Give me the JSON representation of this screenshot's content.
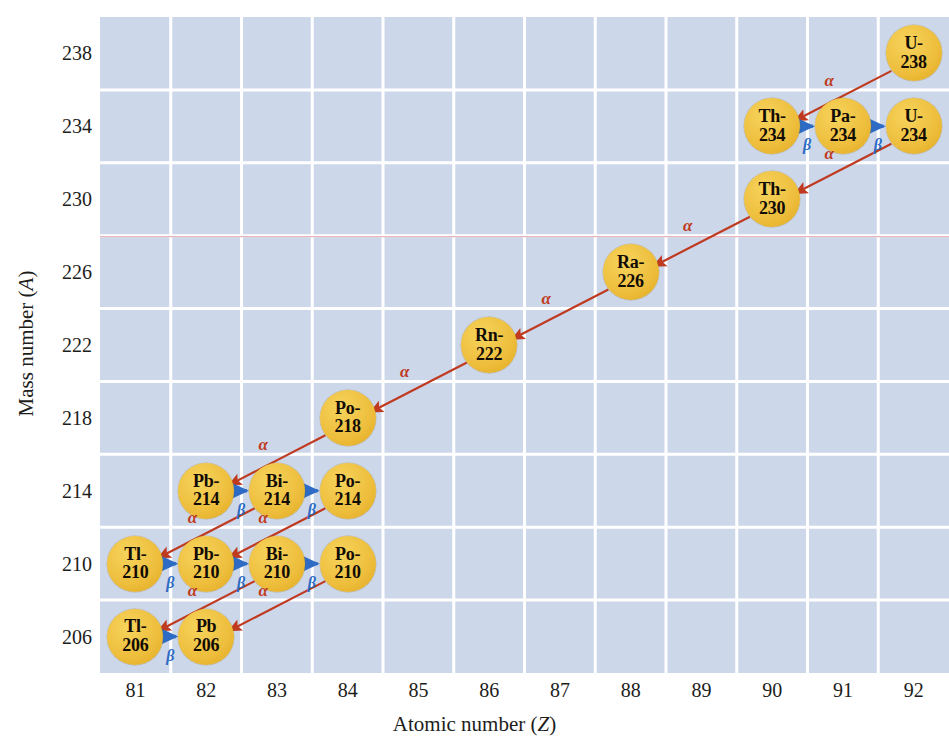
{
  "figure": {
    "kind": "uranium-238-decay-series-chart",
    "background": "#ffffff",
    "panel_color": "#ccd7ea",
    "grid_color": "#ffffff",
    "highlight_line_color": "#e8b7bd",
    "bubble_color": "#eebe3d",
    "alpha_color": "#c03a20",
    "beta_color": "#2e6bc4"
  },
  "axes": {
    "x": {
      "title_text": "Atomic number (",
      "title_italic": "Z",
      "title_tail": ")",
      "ticks": [
        "81",
        "82",
        "83",
        "84",
        "85",
        "86",
        "87",
        "88",
        "89",
        "90",
        "91",
        "92"
      ],
      "min": 80.5,
      "max": 92.5
    },
    "y": {
      "title_text": "Mass number (",
      "title_italic": "A",
      "title_tail": ")",
      "ticks": [
        "238",
        "234",
        "230",
        "226",
        "222",
        "218",
        "214",
        "210",
        "206"
      ],
      "min": 204,
      "max": 240
    }
  },
  "chart_data": {
    "type": "scatter",
    "title": "",
    "xlabel": "Atomic number (Z)",
    "ylabel": "Mass number (A)",
    "xlim": [
      80.5,
      92.5
    ],
    "ylim": [
      204,
      240
    ],
    "grid": true,
    "legend": "none",
    "nuclides": [
      {
        "id": "U-238",
        "symbol": "U-",
        "mass": "238",
        "z": 92,
        "a": 238
      },
      {
        "id": "Th-234",
        "symbol": "Th-",
        "mass": "234",
        "z": 90,
        "a": 234
      },
      {
        "id": "Pa-234",
        "symbol": "Pa-",
        "mass": "234",
        "z": 91,
        "a": 234
      },
      {
        "id": "U-234",
        "symbol": "U-",
        "mass": "234",
        "z": 92,
        "a": 234
      },
      {
        "id": "Th-230",
        "symbol": "Th-",
        "mass": "230",
        "z": 90,
        "a": 230
      },
      {
        "id": "Ra-226",
        "symbol": "Ra-",
        "mass": "226",
        "z": 88,
        "a": 226
      },
      {
        "id": "Rn-222",
        "symbol": "Rn-",
        "mass": "222",
        "z": 86,
        "a": 222
      },
      {
        "id": "Po-218",
        "symbol": "Po-",
        "mass": "218",
        "z": 84,
        "a": 218
      },
      {
        "id": "Pb-214",
        "symbol": "Pb-",
        "mass": "214",
        "z": 82,
        "a": 214
      },
      {
        "id": "Bi-214",
        "symbol": "Bi-",
        "mass": "214",
        "z": 83,
        "a": 214
      },
      {
        "id": "Po-214",
        "symbol": "Po-",
        "mass": "214",
        "z": 84,
        "a": 214
      },
      {
        "id": "Tl-210",
        "symbol": "Tl-",
        "mass": "210",
        "z": 81,
        "a": 210
      },
      {
        "id": "Pb-210",
        "symbol": "Pb-",
        "mass": "210",
        "z": 82,
        "a": 210
      },
      {
        "id": "Bi-210",
        "symbol": "Bi-",
        "mass": "210",
        "z": 83,
        "a": 210
      },
      {
        "id": "Po-210",
        "symbol": "Po-",
        "mass": "210",
        "z": 84,
        "a": 210
      },
      {
        "id": "Tl-206",
        "symbol": "Tl-",
        "mass": "206",
        "z": 81,
        "a": 206
      },
      {
        "id": "Pb-206",
        "symbol": "Pb",
        "mass": "206",
        "z": 82,
        "a": 206
      }
    ],
    "decays": [
      {
        "from": "U-238",
        "to": "Th-234",
        "mode": "alpha",
        "label": "α"
      },
      {
        "from": "Th-234",
        "to": "Pa-234",
        "mode": "beta",
        "label": "β"
      },
      {
        "from": "Pa-234",
        "to": "U-234",
        "mode": "beta",
        "label": "β"
      },
      {
        "from": "U-234",
        "to": "Th-230",
        "mode": "alpha",
        "label": "α"
      },
      {
        "from": "Th-230",
        "to": "Ra-226",
        "mode": "alpha",
        "label": "α"
      },
      {
        "from": "Ra-226",
        "to": "Rn-222",
        "mode": "alpha",
        "label": "α"
      },
      {
        "from": "Rn-222",
        "to": "Po-218",
        "mode": "alpha",
        "label": "α"
      },
      {
        "from": "Po-218",
        "to": "Pb-214",
        "mode": "alpha",
        "label": "α"
      },
      {
        "from": "Pb-214",
        "to": "Bi-214",
        "mode": "beta",
        "label": "β"
      },
      {
        "from": "Bi-214",
        "to": "Po-214",
        "mode": "beta",
        "label": "β"
      },
      {
        "from": "Bi-214",
        "to": "Tl-210",
        "mode": "alpha",
        "label": "α"
      },
      {
        "from": "Po-214",
        "to": "Pb-210",
        "mode": "alpha",
        "label": "α"
      },
      {
        "from": "Tl-210",
        "to": "Pb-210",
        "mode": "beta",
        "label": "β"
      },
      {
        "from": "Pb-210",
        "to": "Bi-210",
        "mode": "beta",
        "label": "β"
      },
      {
        "from": "Bi-210",
        "to": "Po-210",
        "mode": "beta",
        "label": "β"
      },
      {
        "from": "Bi-210",
        "to": "Tl-206",
        "mode": "alpha",
        "label": "α"
      },
      {
        "from": "Po-210",
        "to": "Pb-206",
        "mode": "alpha",
        "label": "α"
      },
      {
        "from": "Tl-206",
        "to": "Pb-206",
        "mode": "beta",
        "label": "β"
      }
    ]
  }
}
